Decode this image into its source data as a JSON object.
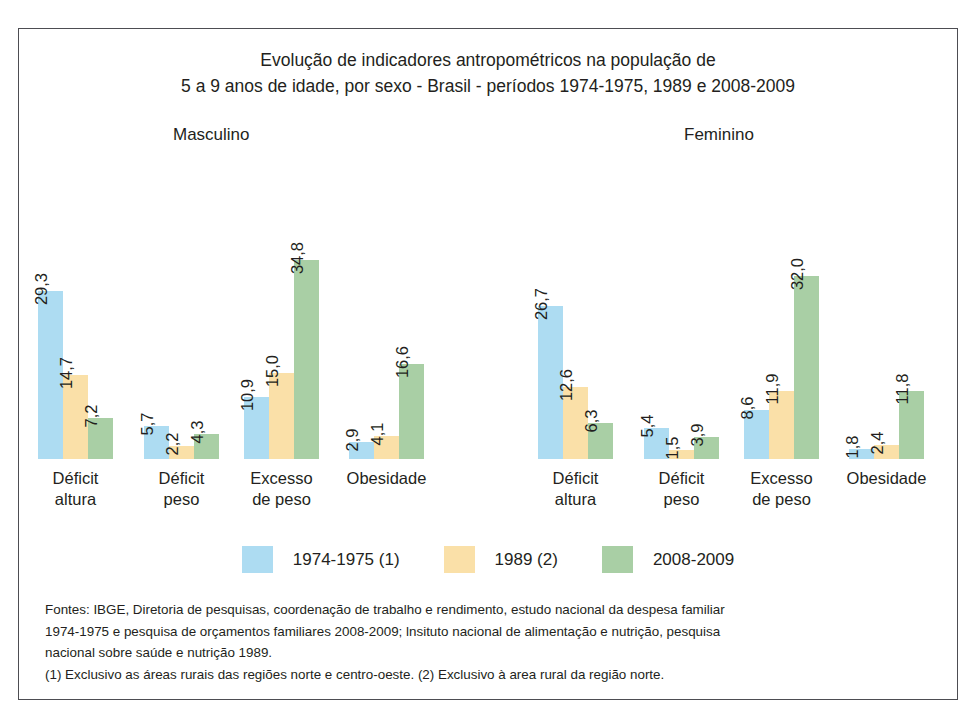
{
  "chart_data": {
    "type": "bar",
    "title": "Evolução de indicadores antropométricos na população de 5 a 9 anos de idade, por sexo - Brasil - períodos 1974-1975, 1989 e 2008-2009",
    "title_line_1": "Evolução de indicadores antropométricos na população de",
    "title_line_2": "5 a 9 anos de idade, por sexo - Brasil - períodos 1974-1975, 1989 e 2008-2009",
    "xlabel": "",
    "ylabel": "",
    "ylim": [
      0,
      36
    ],
    "grid": false,
    "legend_position": "bottom",
    "panels": [
      {
        "name": "Masculino",
        "categories": [
          "Déficit altura",
          "Déficit peso",
          "Excesso de peso",
          "Obesidade"
        ],
        "category_lines": [
          [
            "Déficit",
            "altura"
          ],
          [
            "Déficit",
            "peso"
          ],
          [
            "Excesso",
            "de peso"
          ],
          [
            "Obesidade",
            ""
          ]
        ],
        "series": [
          {
            "name": "1974-1975 (1)",
            "values": [
              29.3,
              5.7,
              10.9,
              2.9
            ],
            "labels": [
              "29,3",
              "5,7",
              "10,9",
              "2,9"
            ],
            "color": "#addcf2"
          },
          {
            "name": "1989 (2)",
            "values": [
              14.7,
              2.2,
              15.0,
              4.1
            ],
            "labels": [
              "14,7",
              "2,2",
              "15,0",
              "4,1"
            ],
            "color": "#fae0a8"
          },
          {
            "name": "2008-2009",
            "values": [
              7.2,
              4.3,
              34.8,
              16.6
            ],
            "labels": [
              "7,2",
              "4,3",
              "34,8",
              "16,6"
            ],
            "color": "#a9cfa5"
          }
        ]
      },
      {
        "name": "Feminino",
        "categories": [
          "Déficit altura",
          "Déficit peso",
          "Excesso de peso",
          "Obesidade"
        ],
        "category_lines": [
          [
            "Déficit",
            "altura"
          ],
          [
            "Déficit",
            "peso"
          ],
          [
            "Excesso",
            "de peso"
          ],
          [
            "Obesidade",
            ""
          ]
        ],
        "series": [
          {
            "name": "1974-1975 (1)",
            "values": [
              26.7,
              5.4,
              8.6,
              1.8
            ],
            "labels": [
              "26,7",
              "5,4",
              "8,6",
              "1,8"
            ],
            "color": "#addcf2"
          },
          {
            "name": "1989 (2)",
            "values": [
              12.6,
              1.5,
              11.9,
              2.4
            ],
            "labels": [
              "12,6",
              "1,5",
              "11,9",
              "2,4"
            ],
            "color": "#fae0a8"
          },
          {
            "name": "2008-2009",
            "values": [
              6.3,
              3.9,
              32.0,
              11.8
            ],
            "labels": [
              "6,3",
              "3,9",
              "32,0",
              "11,8"
            ],
            "color": "#a9cfa5"
          }
        ]
      }
    ],
    "legend": [
      {
        "label": "1974-1975 (1)",
        "color": "#addcf2"
      },
      {
        "label": "1989 (2)",
        "color": "#fae0a8"
      },
      {
        "label": "2008-2009",
        "color": "#a9cfa5"
      }
    ]
  },
  "footnotes": {
    "line_1": "Fontes: IBGE, Diretoria de pesquisas, coordenação de trabalho e rendimento, estudo nacional da despesa familiar",
    "line_2": "1974-1975 e pesquisa de orçamentos familiares 2008-2009; lnsituto nacional de alimentação e nutrição, pesquisa",
    "line_3": "nacional sobre saúde e nutrição 1989.",
    "line_4": "(1) Exclusivo as áreas rurais das regiões norte e centro-oeste. (2) Exclusivo à area rural da região norte."
  }
}
